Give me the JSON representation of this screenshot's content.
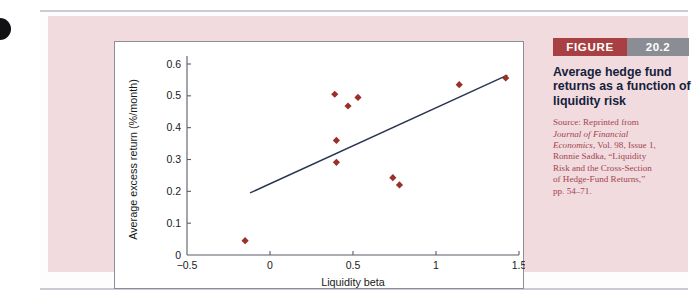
{
  "figure": {
    "badge_label": "FIGURE",
    "badge_number": "20.2",
    "title": "Average hedge fund returns as a function of liquidity risk",
    "source_lines": [
      "Source: Reprinted from",
      "Journal of Financial",
      "Economics, Vol. 98, Issue 1,",
      "Ronnie Sadka, “Liquidity",
      "Risk and the Cross-Section",
      "of Hedge-Fund Returns,”",
      "pp. 54–71."
    ],
    "source_label": "Source: Reprinted from Journal of Financial Economics, Vol. 98, Issue 1, Ronnie Sadka, “Liquidity Risk and the Cross-Section of Hedge-Fund Returns,” pp. 54–71."
  },
  "colors": {
    "panel_background": "#f1dbdf",
    "plot_background": "#ffffff",
    "marker": "#9b3028",
    "trendline": "#2a3550",
    "axis": "#5a5c66",
    "badge_label_bg": "#a83f43",
    "badge_num_bg": "#8b8d95",
    "title_text": "#16213c",
    "source_text": "#a4454d"
  },
  "chart_data": {
    "type": "scatter",
    "title": "",
    "xlabel": "Liquidity beta",
    "ylabel": "Average excess return (%/month)",
    "xlim": [
      -0.5,
      1.5
    ],
    "ylim": [
      0,
      0.6
    ],
    "xticks": [
      -0.5,
      0,
      0.5,
      1,
      1.5
    ],
    "xtick_labels": [
      "−0.5",
      "0",
      "0.5",
      "1",
      "1.5"
    ],
    "yticks": [
      0,
      0.1,
      0.2,
      0.3,
      0.4,
      0.5,
      0.6
    ],
    "ytick_labels": [
      "0",
      "0.1",
      "0.2",
      "0.3",
      "0.4",
      "0.5",
      "0.6"
    ],
    "grid": false,
    "legend": false,
    "marker_shape": "diamond",
    "points": [
      {
        "x": -0.15,
        "y": 0.045
      },
      {
        "x": 0.39,
        "y": 0.505
      },
      {
        "x": 0.4,
        "y": 0.36
      },
      {
        "x": 0.4,
        "y": 0.291
      },
      {
        "x": 0.47,
        "y": 0.468
      },
      {
        "x": 0.53,
        "y": 0.495
      },
      {
        "x": 0.74,
        "y": 0.243
      },
      {
        "x": 0.78,
        "y": 0.22
      },
      {
        "x": 1.14,
        "y": 0.535
      },
      {
        "x": 1.42,
        "y": 0.556
      }
    ],
    "trendline": {
      "x": [
        -0.12,
        1.43
      ],
      "y": [
        0.195,
        0.565
      ]
    }
  }
}
